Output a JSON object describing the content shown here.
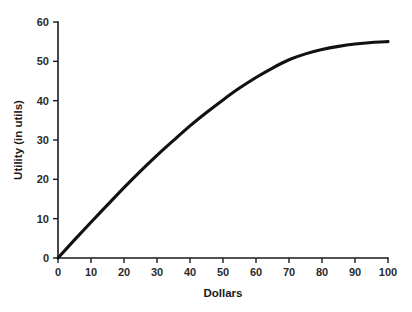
{
  "chart_data": {
    "type": "line",
    "title": "",
    "xlabel": "Dollars",
    "ylabel": "Utility (in utils)",
    "xlim": [
      0,
      100
    ],
    "ylim": [
      0,
      60
    ],
    "xticks": [
      0,
      10,
      20,
      30,
      40,
      50,
      60,
      70,
      80,
      90,
      100
    ],
    "yticks": [
      0,
      10,
      20,
      30,
      40,
      50,
      60
    ],
    "xtick_labels": [
      "0",
      "10",
      "20",
      "30",
      "40",
      "50",
      "60",
      "70",
      "80",
      "90",
      "100"
    ],
    "ytick_labels": [
      "0",
      "10",
      "20",
      "30",
      "40",
      "50",
      "60"
    ],
    "grid": false,
    "legend": false,
    "series": [
      {
        "name": "Utility",
        "x": [
          0,
          5,
          10,
          15,
          20,
          25,
          30,
          35,
          40,
          45,
          50,
          55,
          60,
          65,
          70,
          75,
          80,
          85,
          90,
          95,
          100
        ],
        "values": [
          0,
          4.6,
          9.1,
          13.5,
          17.9,
          22.1,
          26.1,
          29.9,
          33.6,
          37.0,
          40.2,
          43.2,
          45.9,
          48.3,
          50.4,
          51.9,
          53.0,
          53.8,
          54.4,
          54.8,
          55.0
        ]
      }
    ],
    "line_color": "#111111",
    "axis_color": "#1a1a1a"
  },
  "axes": {
    "x_title": "Dollars",
    "y_title": "Utility (in utils)"
  }
}
